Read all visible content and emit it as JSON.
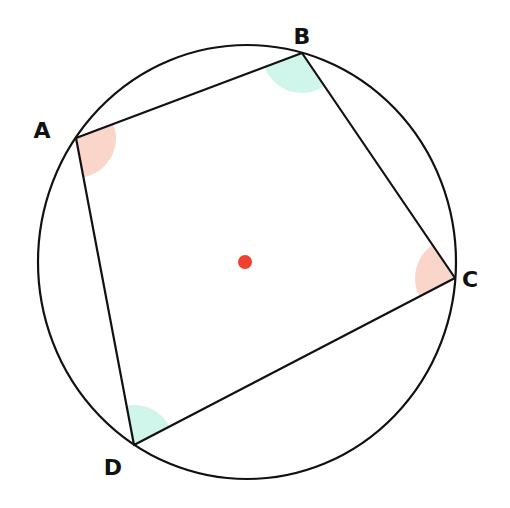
{
  "colors": {
    "stroke": "#111111",
    "angle_pair_1": "#f8cfc0",
    "angle_pair_2": "#c8f3e6",
    "center": "#f0412e",
    "background": "#ffffff"
  },
  "circle": {
    "cx": 247,
    "cy": 262,
    "rx": 209,
    "ry": 217
  },
  "center_point": {
    "x": 245,
    "y": 262,
    "r": 7
  },
  "vertices": [
    {
      "label": "A",
      "x": 76,
      "y": 138,
      "lx": 42,
      "ly": 138,
      "angle_fill": "angle_pair_1"
    },
    {
      "label": "B",
      "x": 302,
      "y": 53,
      "lx": 302,
      "ly": 44,
      "angle_fill": "angle_pair_2"
    },
    {
      "label": "C",
      "x": 455,
      "y": 278,
      "lx": 470,
      "ly": 287,
      "angle_fill": "angle_pair_1"
    },
    {
      "label": "D",
      "x": 134,
      "y": 445,
      "lx": 113,
      "ly": 475,
      "angle_fill": "angle_pair_2"
    }
  ],
  "labels": {
    "A": "A",
    "B": "B",
    "C": "C",
    "D": "D"
  }
}
